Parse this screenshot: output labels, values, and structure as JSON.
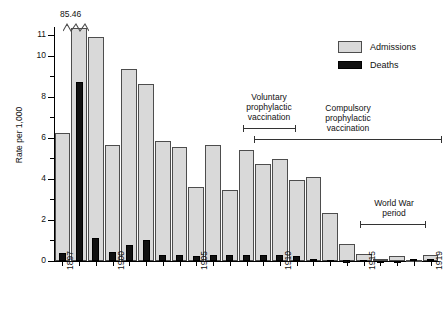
{
  "chart_data": {
    "type": "bar",
    "title": "",
    "xlabel": "",
    "ylabel": "Rate per 1,000",
    "ylim": [
      0,
      11.4
    ],
    "yticks_labeled": [
      0,
      2,
      4,
      6,
      8,
      10,
      11
    ],
    "yticks_minor": [
      1,
      3,
      5,
      7,
      9
    ],
    "grid": false,
    "legend_position": "top-right",
    "categories": [
      1897,
      1898,
      1899,
      1900,
      1901,
      1902,
      1903,
      1904,
      1905,
      1906,
      1907,
      1908,
      1909,
      1910,
      1911,
      1912,
      1913,
      1914,
      1915,
      1916,
      1917,
      1918,
      1919
    ],
    "xtick_labels": [
      "1897",
      "1900",
      "1905",
      "1910",
      "1915",
      "1919"
    ],
    "xtick_label_years": [
      1897,
      1900,
      1905,
      1910,
      1915,
      1919
    ],
    "series": [
      {
        "name": "Admissions",
        "color": "#d9d9d9",
        "values": [
          6.25,
          85.46,
          10.9,
          5.65,
          9.35,
          8.6,
          5.85,
          5.55,
          3.6,
          5.65,
          3.45,
          5.4,
          4.75,
          4.95,
          3.95,
          4.1,
          2.35,
          0.85,
          0.35,
          0.12,
          0.22,
          0.06,
          0.3
        ],
        "display_values": [
          6.25,
          11.35,
          10.9,
          5.65,
          9.35,
          8.6,
          5.85,
          5.55,
          3.6,
          5.65,
          3.45,
          5.4,
          4.75,
          4.95,
          3.95,
          4.1,
          2.35,
          0.85,
          0.35,
          0.12,
          0.22,
          0.06,
          0.3
        ]
      },
      {
        "name": "Deaths",
        "color": "#111111",
        "values": [
          0.38,
          8.7,
          1.1,
          0.45,
          0.8,
          1.0,
          0.28,
          0.28,
          0.26,
          0.3,
          0.3,
          0.3,
          0.3,
          0.28,
          0.22,
          0.1,
          0.07,
          0.03,
          0.05,
          0.02,
          0.02,
          0.12,
          0.1
        ]
      }
    ],
    "annotations": [
      {
        "name": "broken-bar-value",
        "text": "85.46",
        "year": 1898,
        "note": "tall bar truncated with zigzag break"
      },
      {
        "name": "voluntary-vaccination",
        "text": "Voluntary\nprophylactic\nvaccination",
        "span": [
          1906,
          1909
        ]
      },
      {
        "name": "compulsory-vaccination",
        "text": "Compulsory\nprophylactic\nvaccination",
        "span": [
          1908,
          1919
        ]
      },
      {
        "name": "world-war-period",
        "text": "World War\nperiod",
        "span": [
          1915.5,
          1918.5
        ]
      }
    ]
  },
  "legend": {
    "items": [
      {
        "label": "Admissions",
        "swatch": "admissions-swatch"
      },
      {
        "label": "Deaths",
        "swatch": "deaths-swatch"
      }
    ]
  },
  "axes": {
    "y_title": "Rate per 1,000",
    "y_labels": [
      "11",
      "10",
      "8",
      "6",
      "4",
      "2",
      "0"
    ],
    "x_labels": [
      "1897",
      "1900",
      "1905",
      "1910",
      "1915",
      "1919"
    ]
  },
  "annotations_text": {
    "break_value": "85.46",
    "voluntary": "Voluntary\nprophylactic\nvaccination",
    "compulsory": "Compulsory\nprophylactic\nvaccination",
    "world_war": "World War\nperiod"
  }
}
